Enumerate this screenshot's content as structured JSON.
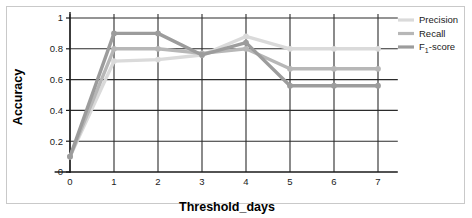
{
  "chart_data": {
    "type": "line",
    "title": "",
    "xlabel": "Threshold_days",
    "ylabel": "Accuracy",
    "x": [
      0,
      1,
      2,
      3,
      4,
      5,
      6,
      7
    ],
    "xlim": [
      -0.35,
      7.45
    ],
    "ylim": [
      0,
      1
    ],
    "xticks": [
      "0",
      "1",
      "2",
      "3",
      "4",
      "5",
      "6",
      "7"
    ],
    "yticks": [
      "0",
      "0.2",
      "0.4",
      "0.6",
      "0.8",
      "1"
    ],
    "ytick_values": [
      0,
      0.2,
      0.4,
      0.6,
      0.8,
      1
    ],
    "grid": true,
    "grid_axes": "both",
    "legend_position": "top-right",
    "series": [
      {
        "name": "Precision",
        "color": "#dadada",
        "values": [
          0.1,
          0.72,
          0.73,
          0.76,
          0.88,
          0.8,
          0.8,
          0.8
        ]
      },
      {
        "name": "Recall",
        "color": "#b7b7b7",
        "values": [
          0.1,
          0.8,
          0.8,
          0.77,
          0.8,
          0.67,
          0.67,
          0.67
        ]
      },
      {
        "name": "F₁-score",
        "color": "#9c9c9c",
        "values": [
          0.1,
          0.9,
          0.9,
          0.76,
          0.84,
          0.56,
          0.56,
          0.56
        ]
      }
    ]
  },
  "legend": {
    "entries": [
      {
        "label": "Precision",
        "base": "Precision",
        "sub": "",
        "tail": ""
      },
      {
        "label": "Recall",
        "base": "Recall",
        "sub": "",
        "tail": ""
      },
      {
        "label": "F₁-score",
        "base": "F",
        "sub": "1",
        "tail": "-score"
      }
    ]
  },
  "axes": {
    "x_title": "Threshold_days",
    "y_title": "Accuracy"
  },
  "colors": {
    "precision": "#dadada",
    "recall": "#b7b7b7",
    "f1": "#9c9c9c",
    "axis": "#1a1a1a",
    "grid": "#2b2b2b",
    "frame": "#c9c9c9",
    "background": "#ffffff"
  }
}
